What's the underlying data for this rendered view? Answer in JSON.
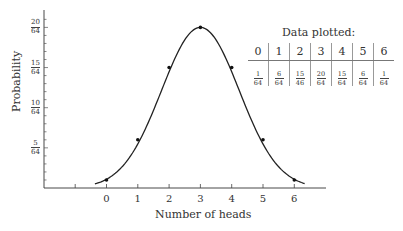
{
  "chart_data": {
    "type": "line",
    "title": "",
    "xlabel": "Number of heads",
    "ylabel": "Probability",
    "x": [
      0,
      1,
      2,
      3,
      4,
      5,
      6
    ],
    "series": [
      {
        "name": "Probability",
        "values_num": [
          1,
          6,
          15,
          20,
          15,
          6,
          1
        ],
        "denominator": 64,
        "values": [
          0.015625,
          0.09375,
          0.234375,
          0.3125,
          0.234375,
          0.09375,
          0.015625
        ]
      }
    ],
    "xticks": [
      "",
      "0",
      "1",
      "2",
      "3",
      "4",
      "5",
      "6"
    ],
    "yticks": [
      {
        "num": "5",
        "den": "64"
      },
      {
        "num": "10",
        "den": "64"
      },
      {
        "num": "15",
        "den": "64"
      },
      {
        "num": "20",
        "den": "64"
      }
    ],
    "ylim": [
      0,
      0.34
    ],
    "xlim": [
      -2,
      7
    ],
    "grid": false,
    "smooth_curve": true,
    "legend": null,
    "annotation_table": {
      "title": "Data plotted:",
      "header": [
        "0",
        "1",
        "2",
        "3",
        "4",
        "5",
        "6"
      ],
      "values": [
        {
          "num": "1",
          "den": "64"
        },
        {
          "num": "6",
          "den": "64"
        },
        {
          "num": "15",
          "den": "46"
        },
        {
          "num": "20",
          "den": "64"
        },
        {
          "num": "15",
          "den": "64"
        },
        {
          "num": "6",
          "den": "64"
        },
        {
          "num": "1",
          "den": "64"
        }
      ]
    }
  },
  "colors": {
    "line": "#222222",
    "axis": "#333333",
    "background": "#ffffff"
  }
}
